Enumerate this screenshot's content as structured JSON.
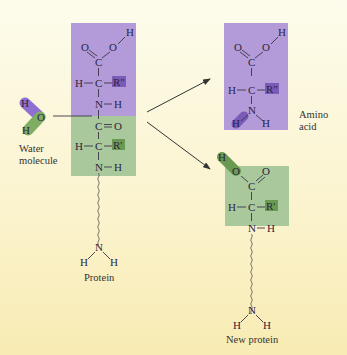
{
  "colors": {
    "purple_box": "#b29ad8",
    "green_box": "#a9c79a",
    "purple_dark": "#7a5bb8",
    "green_dark": "#6a9a52",
    "background_top": "#fdfcec",
    "background_bottom": "#f8ebb3"
  },
  "water": {
    "label_line1": "Water",
    "label_line2": "molecule",
    "atoms": {
      "h_top": "H",
      "o": "O",
      "h_bottom": "H"
    }
  },
  "protein": {
    "label": "Protein",
    "atoms": {
      "o1": "O",
      "o2": "O",
      "h_oh": "H",
      "c1": "C",
      "h_alpha1": "H",
      "c_alpha1": "C",
      "r1": "R\"",
      "n1": "N",
      "h_n1": "H",
      "c2": "C",
      "o3": "O",
      "h_alpha2": "H",
      "c_alpha2": "C",
      "r2": "R'",
      "n2": "N",
      "h_n2": "H",
      "n_term": "N",
      "h_t1": "H",
      "h_t2": "H"
    }
  },
  "amino_acid": {
    "label_line1": "Amino",
    "label_line2": "acid",
    "atoms": {
      "o1": "O",
      "o2": "O",
      "h_oh": "H",
      "c1": "C",
      "h_alpha": "H",
      "c_alpha": "C",
      "r": "R\"",
      "n": "N",
      "h_n1": "H",
      "h_n2": "H"
    }
  },
  "new_protein": {
    "label": "New protein",
    "atoms": {
      "h_oh": "H",
      "o_h": "O",
      "o_dbl": "O",
      "c1": "C",
      "h_alpha": "H",
      "c_alpha": "C",
      "r": "R'",
      "n": "N",
      "h_n": "H",
      "n_term": "N",
      "h_t1": "H",
      "h_t2": "H"
    }
  }
}
